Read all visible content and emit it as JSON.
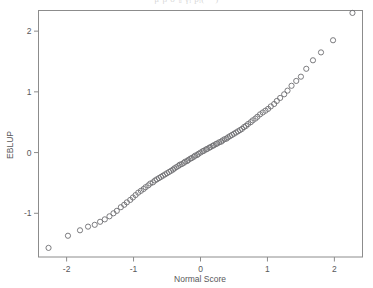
{
  "figure": {
    "type": "qq-plot",
    "clipped_top_text": "μ̂   β̂      σ̂²ᵤ    γ̂ᵢ   p̂ᵢ(⋅⋅⋅)",
    "background_color": "#ffffff",
    "frame_color": "#8c8c8c",
    "marker_color": "#6e6e72",
    "text_color": "#58585a"
  },
  "axes": {
    "x": {
      "label": "Normal Score",
      "ticks": [
        -2,
        -1,
        0,
        1,
        2
      ],
      "tick_labels": [
        "-2",
        "-1",
        "0",
        "1",
        "2"
      ],
      "range": [
        -2.42,
        2.42
      ]
    },
    "y": {
      "label": "EBLUP",
      "ticks": [
        -1,
        0,
        1,
        2
      ],
      "tick_labels": [
        "-1",
        "0",
        "1",
        "2"
      ],
      "range": [
        -1.72,
        2.34
      ]
    }
  },
  "chart_data": {
    "type": "scatter",
    "title": "",
    "xlabel": "Normal Score",
    "ylabel": "EBLUP",
    "xlim": [
      -2.42,
      2.42
    ],
    "ylim": [
      -1.72,
      2.34
    ],
    "grid": false,
    "legend": null,
    "marker": "open-circle",
    "series": [
      {
        "name": "EBLUP vs Normal Score",
        "x": [
          -2.27,
          -1.98,
          -1.8,
          -1.68,
          -1.58,
          -1.5,
          -1.43,
          -1.36,
          -1.3,
          -1.25,
          -1.19,
          -1.14,
          -1.1,
          -1.05,
          -1.01,
          -0.97,
          -0.93,
          -0.89,
          -0.85,
          -0.82,
          -0.78,
          -0.75,
          -0.71,
          -0.68,
          -0.65,
          -0.62,
          -0.59,
          -0.56,
          -0.53,
          -0.5,
          -0.47,
          -0.44,
          -0.41,
          -0.39,
          -0.36,
          -0.33,
          -0.31,
          -0.28,
          -0.25,
          -0.23,
          -0.2,
          -0.18,
          -0.15,
          -0.13,
          -0.1,
          -0.08,
          -0.05,
          -0.03,
          0.0,
          0.03,
          0.05,
          0.08,
          0.1,
          0.13,
          0.15,
          0.18,
          0.2,
          0.23,
          0.25,
          0.28,
          0.31,
          0.33,
          0.36,
          0.39,
          0.41,
          0.44,
          0.47,
          0.5,
          0.53,
          0.56,
          0.59,
          0.62,
          0.65,
          0.68,
          0.71,
          0.75,
          0.78,
          0.82,
          0.85,
          0.89,
          0.93,
          0.97,
          1.01,
          1.05,
          1.1,
          1.14,
          1.19,
          1.25,
          1.3,
          1.36,
          1.43,
          1.5,
          1.58,
          1.68,
          1.8,
          1.98,
          2.27
        ],
        "y": [
          -1.57,
          -1.37,
          -1.28,
          -1.22,
          -1.19,
          -1.14,
          -1.1,
          -1.05,
          -1.0,
          -0.96,
          -0.9,
          -0.86,
          -0.82,
          -0.78,
          -0.74,
          -0.7,
          -0.66,
          -0.63,
          -0.6,
          -0.57,
          -0.54,
          -0.51,
          -0.49,
          -0.46,
          -0.44,
          -0.42,
          -0.4,
          -0.38,
          -0.36,
          -0.34,
          -0.32,
          -0.3,
          -0.28,
          -0.26,
          -0.24,
          -0.22,
          -0.2,
          -0.19,
          -0.17,
          -0.15,
          -0.14,
          -0.12,
          -0.1,
          -0.09,
          -0.07,
          -0.05,
          -0.04,
          -0.02,
          0.0,
          0.02,
          0.03,
          0.05,
          0.06,
          0.08,
          0.09,
          0.11,
          0.12,
          0.14,
          0.15,
          0.17,
          0.18,
          0.2,
          0.22,
          0.23,
          0.25,
          0.27,
          0.29,
          0.31,
          0.33,
          0.35,
          0.37,
          0.39,
          0.42,
          0.44,
          0.47,
          0.5,
          0.53,
          0.56,
          0.59,
          0.63,
          0.66,
          0.69,
          0.72,
          0.76,
          0.8,
          0.85,
          0.9,
          0.96,
          1.02,
          1.1,
          1.18,
          1.25,
          1.38,
          1.52,
          1.65,
          1.85,
          2.3
        ]
      }
    ]
  }
}
